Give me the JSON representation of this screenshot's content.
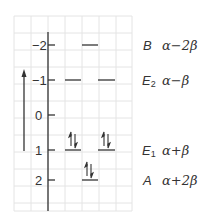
{
  "diagram": {
    "type": "molecular-orbital-energy-level-diagram",
    "axis": {
      "ticks": [
        {
          "label": "−2",
          "value": -2
        },
        {
          "label": "−1",
          "value": -1
        },
        {
          "label": "0",
          "value": 0
        },
        {
          "label": "1",
          "value": 1
        },
        {
          "label": "2",
          "value": 2
        }
      ],
      "arrow_direction": "up"
    },
    "levels": [
      {
        "symmetry": "B",
        "subscript": "",
        "energy": "α−2β",
        "tick_value": -2,
        "degeneracy": 1,
        "electrons": 0
      },
      {
        "symmetry": "E",
        "subscript": "2",
        "energy": "α−β",
        "tick_value": -1,
        "degeneracy": 2,
        "electrons": 0
      },
      {
        "symmetry": "E",
        "subscript": "1",
        "energy": "α+β",
        "tick_value": 1,
        "degeneracy": 2,
        "electrons": 4
      },
      {
        "symmetry": "A",
        "subscript": "",
        "energy": "α+2β",
        "tick_value": 2,
        "degeneracy": 1,
        "electrons": 2
      }
    ],
    "colors": {
      "grid": "#e6e6e6",
      "lines": "#333333",
      "text": "#333333",
      "background": "#ffffff"
    }
  }
}
